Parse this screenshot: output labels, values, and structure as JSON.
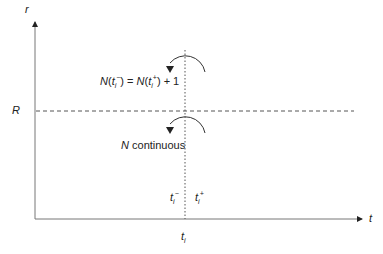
{
  "diagram": {
    "axes": {
      "y_label": "r",
      "x_label": "t"
    },
    "threshold": {
      "label": "R"
    },
    "event_time": {
      "label": "t",
      "subscript": "i"
    },
    "annotations": {
      "jump": {
        "lhs_fn": "N",
        "lhs_arg": "t",
        "lhs_sub": "i",
        "lhs_sup": "−",
        "eq": " = ",
        "rhs_fn": "N",
        "rhs_arg": "t",
        "rhs_sub": "i",
        "rhs_sup": "+",
        "rhs_tail": " + 1"
      },
      "continuous": {
        "var": "N",
        "text": " continuous"
      },
      "t_minus": {
        "base": "t",
        "sub": "i",
        "sup": "−"
      },
      "t_plus": {
        "base": "t",
        "sub": "i",
        "sup": "+"
      }
    },
    "colors": {
      "line": "#555555",
      "text": "#222222"
    }
  }
}
